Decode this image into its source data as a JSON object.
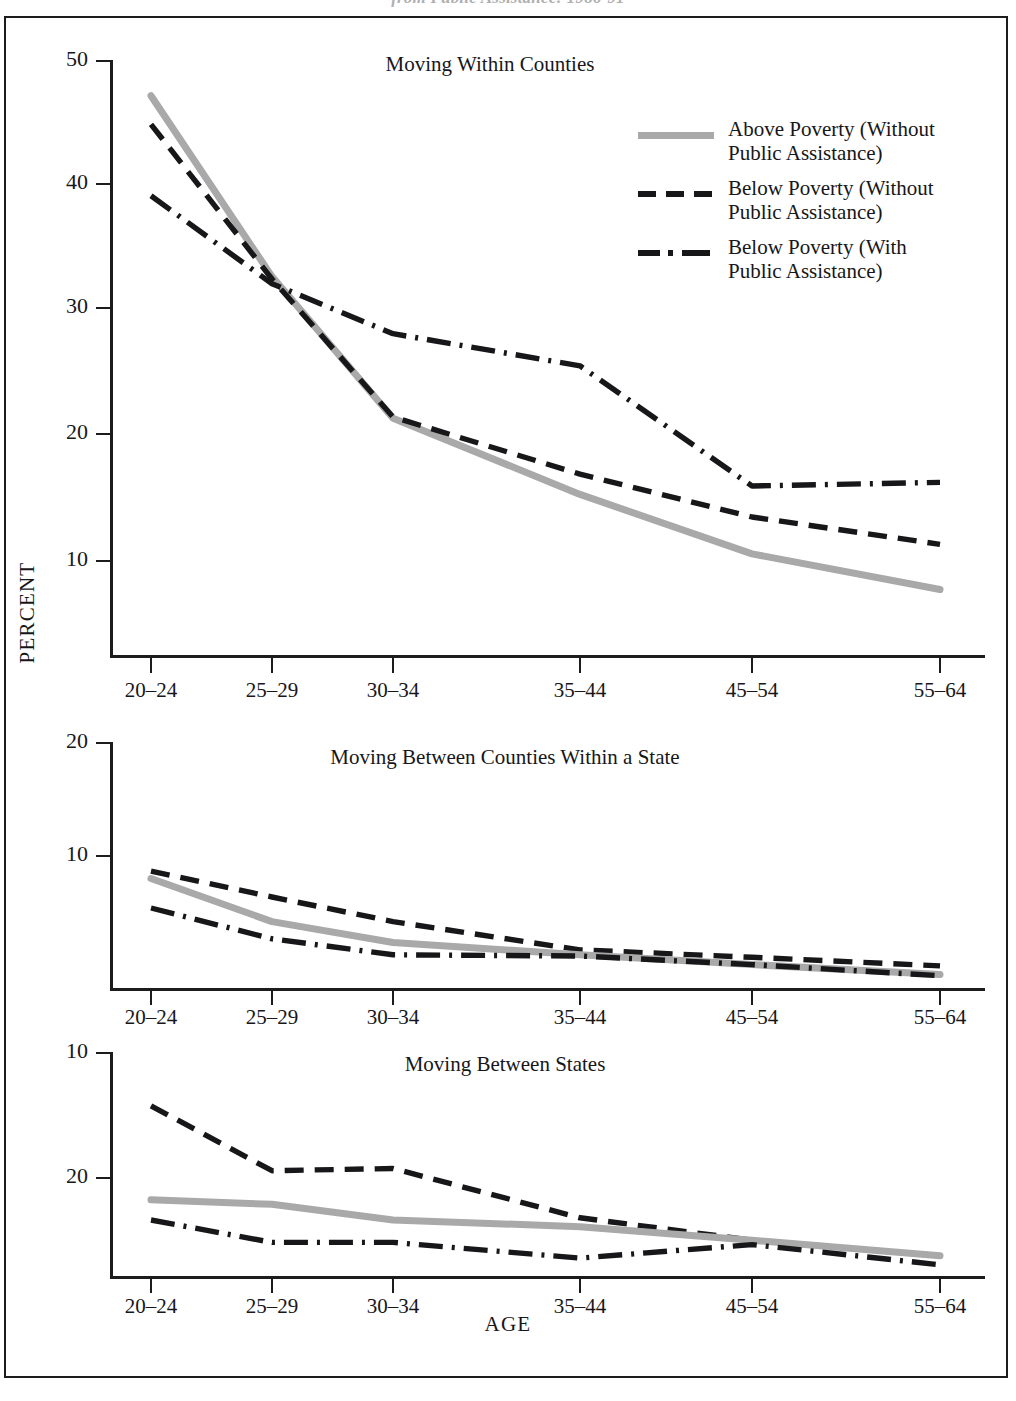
{
  "figure": {
    "cropped_caption": "from Public Assistance: 1986-91",
    "ylabel": "PERCENT",
    "xlabel": "AGE"
  },
  "legend": {
    "items": [
      {
        "label_line1": "Above Poverty (Without",
        "label_line2": "Public Assistance)",
        "style": "solid",
        "color": "#a9a9a9"
      },
      {
        "label_line1": "Below Poverty (Without",
        "label_line2": "Public Assistance)",
        "style": "dashed",
        "color": "#17171a"
      },
      {
        "label_line1": "Below Poverty (With",
        "label_line2": "Public Assistance)",
        "style": "dash-dot",
        "color": "#17171a"
      }
    ]
  },
  "chart_data": [
    {
      "type": "line",
      "title": "Moving Within Counties",
      "xlabel": "AGE",
      "ylabel": "PERCENT",
      "categories": [
        "20–24",
        "25–29",
        "30–34",
        "35–44",
        "45–54",
        "55–64"
      ],
      "yticks": [
        10,
        20,
        30,
        40,
        50
      ],
      "ylim": [
        0,
        50
      ],
      "grid": false,
      "legend_position": "upper-right",
      "series": [
        {
          "name": "Above Poverty (Without Public Assistance)",
          "style": "solid",
          "values": [
            47.0,
            31.8,
            19.9,
            13.5,
            8.5,
            5.5
          ]
        },
        {
          "name": "Below Poverty (Without Public Assistance)",
          "style": "dashed",
          "values": [
            44.6,
            31.6,
            20.0,
            15.2,
            11.6,
            9.3
          ]
        },
        {
          "name": "Below Poverty (With Public Assistance)",
          "style": "dash-dot",
          "values": [
            38.6,
            31.2,
            27.0,
            24.3,
            14.2,
            14.5
          ]
        }
      ]
    },
    {
      "type": "line",
      "title": "Moving Between Counties Within a State",
      "xlabel": "AGE",
      "ylabel": "PERCENT",
      "categories": [
        "20–24",
        "25–29",
        "30–34",
        "35–44",
        "45–54",
        "55–64"
      ],
      "yticks": [
        10,
        20
      ],
      "ylim": [
        0,
        20
      ],
      "grid": false,
      "series": [
        {
          "name": "Above Poverty (Without Public Assistance)",
          "style": "solid",
          "values": [
            8.9,
            5.4,
            3.7,
            2.7,
            1.9,
            1.1
          ]
        },
        {
          "name": "Below Poverty (Without Public Assistance)",
          "style": "dashed",
          "values": [
            9.5,
            7.4,
            5.4,
            3.1,
            2.5,
            1.8
          ]
        },
        {
          "name": "Below Poverty (With Public Assistance)",
          "style": "dash-dot",
          "values": [
            6.5,
            4.0,
            2.7,
            2.6,
            1.9,
            1.0
          ]
        }
      ]
    },
    {
      "type": "line",
      "title": "Moving Between States",
      "xlabel": "AGE",
      "ylabel": "PERCENT",
      "categories": [
        "20–24",
        "25–29",
        "30–34",
        "35–44",
        "45–54",
        "55–64"
      ],
      "yticks": [
        10,
        20
      ],
      "ylim": [
        0,
        10
      ],
      "grid": false,
      "series": [
        {
          "name": "Above Poverty (Without Public Assistance)",
          "style": "solid",
          "values": [
            3.4,
            3.2,
            2.5,
            2.2,
            1.6,
            0.9
          ]
        },
        {
          "name": "Below Poverty (Without Public Assistance)",
          "style": "dashed",
          "values": [
            7.6,
            4.7,
            4.8,
            2.6,
            1.6,
            0.9
          ]
        },
        {
          "name": "Below Poverty (With Public Assistance)",
          "style": "dash-dot",
          "values": [
            2.5,
            1.5,
            1.5,
            0.8,
            1.4,
            0.5
          ]
        }
      ]
    }
  ]
}
